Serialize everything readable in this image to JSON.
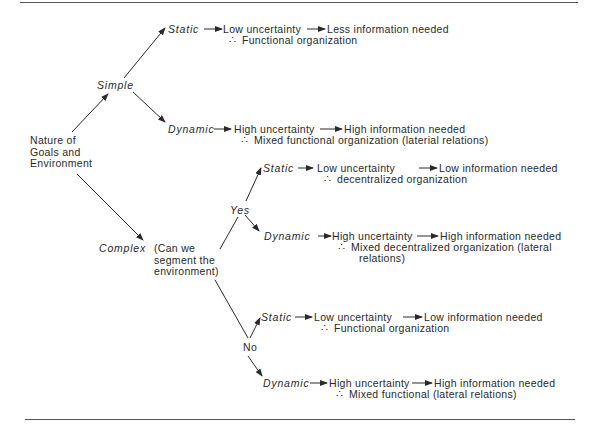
{
  "diagram": {
    "root": {
      "lines": [
        "Nature of",
        "Goals and",
        "Environment"
      ]
    },
    "simple": {
      "label": "Simple",
      "static": {
        "label": "Static",
        "uncertainty": "Low uncertainty",
        "info": "Less information needed",
        "therefore": "∴",
        "conclusion": "Functional organization"
      },
      "dynamic": {
        "label": "Dynamic",
        "uncertainty": "High uncertainty",
        "info": "High information needed",
        "therefore": "∴",
        "conclusion": "Mixed functional organization (laterial relations)"
      }
    },
    "complex": {
      "label": "Complex",
      "question": [
        "(Can we",
        "segment the",
        "environment)"
      ],
      "yes": {
        "label": "Yes",
        "static": {
          "label": "Static",
          "uncertainty": "Low uncertainty",
          "info": "Low information needed",
          "therefore": "∴",
          "conclusion": "decentralized organization"
        },
        "dynamic": {
          "label": "Dynamic",
          "uncertainty": "High uncertainty",
          "info": "High information needed",
          "therefore": "∴",
          "conclusion": [
            "Mixed decentralized organization (lateral",
            "relations)"
          ]
        }
      },
      "no": {
        "label": "No",
        "static": {
          "label": "Static",
          "uncertainty": "Low uncertainty",
          "info": "Low information needed",
          "therefore": "∴",
          "conclusion": "Functional organization"
        },
        "dynamic": {
          "label": "Dynamic",
          "uncertainty": "High uncertainty",
          "info": "High information needed",
          "therefore": "∴",
          "conclusion": "Mixed functional (lateral relations)"
        }
      }
    }
  }
}
